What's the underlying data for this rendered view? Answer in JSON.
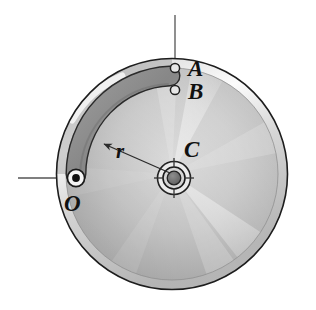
{
  "figure": {
    "background_color": "#ffffff",
    "labels": {
      "point_a": "A",
      "point_b": "B",
      "center_c": "C",
      "pivot_o": "O",
      "radius_r": "r"
    },
    "colors": {
      "disc_outline": "#1a1a1a",
      "disc_fill_light": "#f2f2f2",
      "disc_fill_mid": "#c9c9c9",
      "disc_fill_dark": "#9a9a9a",
      "rim_band": "#b8b8b8",
      "slot_fill": "#8e8e8e",
      "slot_outline": "#2a2a2a",
      "centerline": "#4d4d4d",
      "hub_dark": "#6e6e6e",
      "label_text": "#111111",
      "highlight": "#ffffff"
    },
    "geometry": {
      "disc_center_x": 172,
      "disc_center_y": 174,
      "disc_radius": 116,
      "rim_inner_radius": 106,
      "hub_outer_radius": 17,
      "hub_mid_radius": 11,
      "hub_inner_radius": 7,
      "slot_center_x": 172,
      "slot_center_y": 174,
      "slot_radius": 96,
      "slot_half_width": 9,
      "slot_start_angle_deg": 180,
      "slot_end_angle_deg": 268,
      "hole_a_x": 175,
      "hole_a_y": 68,
      "hole_b_x": 175,
      "hole_b_y": 90,
      "hole_radius": 5,
      "pivot_o_x": 76,
      "pivot_o_y": 178,
      "pivot_outer_radius": 9,
      "pivot_dot_radius": 4,
      "vertical_line_x": 175,
      "vertical_line_top_y": 15,
      "horizontal_line_y": 178,
      "horizontal_line_left_x": 18,
      "horizontal_line_right_x": 262,
      "radius_arrow_from_x": 172,
      "radius_arrow_from_y": 174,
      "radius_arrow_to_x": 102,
      "radius_arrow_to_y": 143
    },
    "elements": {
      "disc": "metallic-disc",
      "slot": "curved-slot",
      "hub": "center-hub",
      "pivot": "pivot-pin",
      "hole_a": "hole-a",
      "hole_b": "hole-b",
      "vertical_centerline": "vertical-centerline",
      "horizontal_centerline": "horizontal-centerline",
      "radius_arrow": "radius-dimension-arrow"
    }
  }
}
